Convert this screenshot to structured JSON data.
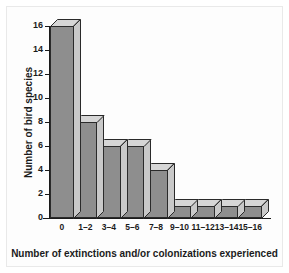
{
  "chart_data": {
    "type": "bar",
    "title": "",
    "xlabel": "Number of extinctions and/or colonizations experienced",
    "ylabel": "Number of bird species",
    "categories": [
      "0",
      "1–2",
      "3–4",
      "5–6",
      "7–8",
      "9–10",
      "11–12",
      "13–14",
      "15–16"
    ],
    "values": [
      16,
      8,
      6,
      6,
      4,
      1,
      1,
      1,
      1
    ],
    "ylim": [
      0,
      16
    ],
    "yticks": [
      0,
      2,
      4,
      6,
      8,
      10,
      12,
      14,
      16
    ],
    "ytick_labels": [
      "0",
      "2",
      "4",
      "6",
      "8",
      "10",
      "12",
      "14",
      "16"
    ],
    "grid": false,
    "legend": null,
    "style": "3d-histogram",
    "colors": {
      "bar_front": "#8e8e8e",
      "bar_top": "#d6d6d6",
      "bar_side": "#c9c9c9",
      "bar_outline": "#2a2a2a",
      "axis": "#1a1a1a",
      "text": "#1b1b1b",
      "background": "#fdfdfd",
      "frame_border": "#e9e9e9"
    }
  }
}
